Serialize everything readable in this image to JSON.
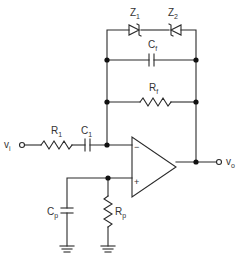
{
  "diagram": {
    "type": "op-amp circuit schematic",
    "labels": {
      "z1": {
        "main": "Z",
        "sub": "1"
      },
      "z2": {
        "main": "Z",
        "sub": "2"
      },
      "cf": {
        "main": "C",
        "sub": "f"
      },
      "rf": {
        "main": "R",
        "sub": "f"
      },
      "r1": {
        "main": "R",
        "sub": "1"
      },
      "c1": {
        "main": "C",
        "sub": "1"
      },
      "cp": {
        "main": "C",
        "sub": "p"
      },
      "rp": {
        "main": "R",
        "sub": "p"
      },
      "vi": {
        "main": "v",
        "sub": "i"
      },
      "vo": {
        "main": "v",
        "sub": "o"
      }
    },
    "opamp": {
      "inverting": "−",
      "noninverting": "+"
    }
  }
}
